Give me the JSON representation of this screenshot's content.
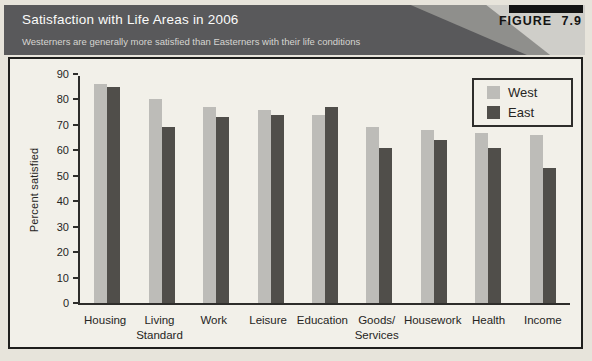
{
  "header": {
    "title": "Satisfaction with Life Areas in 2006",
    "subtitle": "Westerners are generally more satisfied than Easterners with their life conditions",
    "figure_label": "FIGURE 7.9"
  },
  "chart_data": {
    "type": "bar",
    "title": "Satisfaction with Life Areas in 2006",
    "xlabel": "",
    "ylabel": "Percent satisfied",
    "ylim": [
      0,
      90
    ],
    "ytick_step": 10,
    "grid": false,
    "legend_position": "top-right",
    "categories": [
      "Housing",
      "Living\nStandard",
      "Work",
      "Leisure",
      "Education",
      "Goods/\nServices",
      "Housework",
      "Health",
      "Income"
    ],
    "series": [
      {
        "name": "West",
        "color": "#bdbcb8",
        "values": [
          86,
          80,
          77,
          76,
          74,
          69,
          68,
          67,
          66
        ]
      },
      {
        "name": "East",
        "color": "#504e4a",
        "values": [
          85,
          69,
          73,
          74,
          77,
          61,
          64,
          61,
          53
        ]
      }
    ]
  },
  "colors": {
    "page_bg": "#e7e4db",
    "header_bg": "#59595b",
    "header_sweep_mid": "#8f8f8c",
    "header_sweep_light": "#cfcec9",
    "badge_bg": "#131313",
    "title_text": "#fbfbfa",
    "subtitle_text": "#d6d5d1",
    "panel_bg": "#f2f0e9",
    "panel_border": "#1f1f1d",
    "axis": "#2e2d2b",
    "text": "#262523",
    "west_bar": "#bdbcb8",
    "east_bar": "#504e4a"
  }
}
